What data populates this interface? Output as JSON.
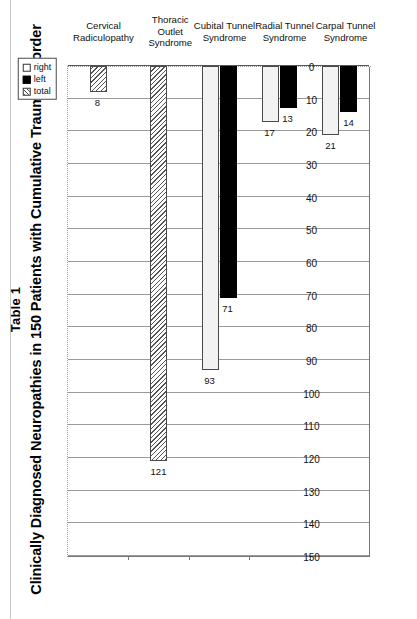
{
  "figure": {
    "table_label": "Table 1",
    "title": "Clinically Diagnosed Neuropathies in 150 Patients with Cumulative Trauma Disorder"
  },
  "legend": {
    "entries": [
      {
        "label": "right",
        "swatch": "open-square-swatch"
      },
      {
        "label": "left",
        "swatch": "filled-square-swatch"
      },
      {
        "label": "total",
        "swatch": "hatched-square-swatch"
      }
    ]
  },
  "axis": {
    "ticks": [
      "150",
      "140",
      "130",
      "120",
      "110",
      "100",
      "90",
      "80",
      "70",
      "60",
      "50",
      "40",
      "30",
      "20",
      "10",
      "0"
    ]
  },
  "chart_data": {
    "type": "bar",
    "title": "Clinically Diagnosed Neuropathies in 150 Patients with Cumulative Trauma Disorder",
    "subtitle": "Table 1",
    "orientation": "vertical",
    "xlabel": "",
    "ylabel": "",
    "ylim": [
      0,
      150
    ],
    "ytick_step": 10,
    "grid": true,
    "legend_position": "top-right",
    "categories": [
      "Cervical Radiculopathy",
      "Thoracic Outlet Syndrome",
      "Cubital Tunnel Syndrome",
      "Radial Tunnel Syndrome",
      "Carpal Tunnel Syndrome"
    ],
    "category_lines": [
      [
        "Cervical",
        "Radiculopathy"
      ],
      [
        "Thoracic",
        "Outlet",
        "Syndrome"
      ],
      [
        "Cubital Tunnel",
        "Syndrome"
      ],
      [
        "Radial Tunnel",
        "Syndrome"
      ],
      [
        "Carpal Tunnel",
        "Syndrome"
      ]
    ],
    "series": [
      {
        "name": "right",
        "values": [
          null,
          null,
          93,
          17,
          21
        ]
      },
      {
        "name": "left",
        "values": [
          null,
          null,
          71,
          13,
          14
        ]
      },
      {
        "name": "total",
        "values": [
          8,
          121,
          null,
          null,
          null
        ]
      }
    ]
  }
}
